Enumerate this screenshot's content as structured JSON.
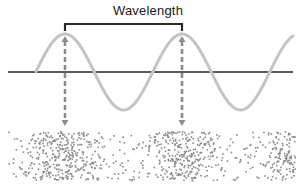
{
  "title": "Wavelength",
  "colors": {
    "wave": "#c4c4c4",
    "baseline": "#222222",
    "bracket": "#2a2a2a",
    "arrow": "#8c8c8c",
    "dots": "#8a8a8a",
    "background": "#ffffff"
  },
  "wave": {
    "baseline_y": 72,
    "baseline_x_start": 8,
    "baseline_x_end": 293,
    "amplitude": 38,
    "wavelength_px": 117,
    "x_start": 36,
    "x_end": 293,
    "first_crest_x": 65
  },
  "bracket": {
    "x1": 65,
    "x2": 182,
    "y": 24,
    "tick": 7
  },
  "arrows": [
    {
      "x": 65,
      "y_top": 36,
      "y_bottom": 126
    },
    {
      "x": 182,
      "y_top": 36,
      "y_bottom": 126
    }
  ],
  "particles": {
    "x_min": 8,
    "x_max": 295,
    "y_min": 131,
    "y_max": 180,
    "compression_centers_x": [
      65,
      182
    ],
    "rarefaction_centers_x": [
      123,
      240
    ]
  }
}
